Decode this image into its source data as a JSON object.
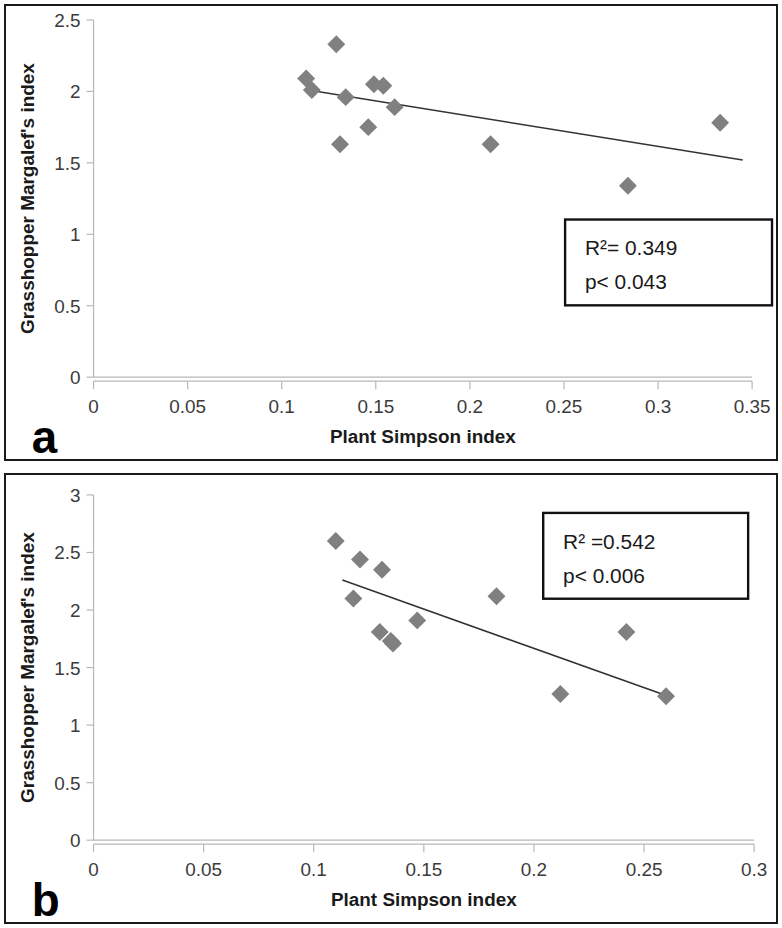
{
  "figure": {
    "panels": [
      {
        "letter": "a",
        "stats": {
          "r2": "R²= 0.349",
          "p": "p< 0.043"
        }
      },
      {
        "letter": "b",
        "stats": {
          "r2": "R² =0.542",
          "p": "p< 0.006"
        }
      }
    ]
  },
  "chart_data": [
    {
      "type": "scatter",
      "panel": "a",
      "title": "",
      "xlabel": "Plant Simpson index",
      "ylabel": "Grasshopper Margalef's index",
      "xlim": [
        0,
        0.35
      ],
      "ylim": [
        0,
        2.5
      ],
      "xticks": [
        0,
        0.05,
        0.1,
        0.15,
        0.2,
        0.25,
        0.3,
        0.35
      ],
      "xticklabels": [
        "0",
        "0.05",
        "0.1",
        "0.15",
        "0.2",
        "0.25",
        "0.3",
        "0.35"
      ],
      "yticks": [
        0,
        0.5,
        1,
        1.5,
        2,
        2.5
      ],
      "yticklabels": [
        "0",
        "0.5",
        "1",
        "1.5",
        "2",
        "2.5"
      ],
      "grid": false,
      "legend": null,
      "marker": "diamond",
      "marker_color": "#808080",
      "points": [
        {
          "x": 0.113,
          "y": 2.09
        },
        {
          "x": 0.116,
          "y": 2.01
        },
        {
          "x": 0.129,
          "y": 2.33
        },
        {
          "x": 0.131,
          "y": 1.63
        },
        {
          "x": 0.134,
          "y": 1.96
        },
        {
          "x": 0.146,
          "y": 1.75
        },
        {
          "x": 0.149,
          "y": 2.05
        },
        {
          "x": 0.154,
          "y": 2.04
        },
        {
          "x": 0.16,
          "y": 1.89
        },
        {
          "x": 0.211,
          "y": 1.63
        },
        {
          "x": 0.284,
          "y": 1.34
        },
        {
          "x": 0.333,
          "y": 1.78
        }
      ],
      "trendline": {
        "x0": 0.114,
        "y0": 2.01,
        "x1": 0.345,
        "y1": 1.52
      },
      "annotations": [
        {
          "text": "R²= 0.349",
          "x": 0.25,
          "y": 1.12
        },
        {
          "text": "p< 0.043",
          "x": 0.25,
          "y": 0.92
        }
      ],
      "r_squared": 0.349,
      "p_value": "< 0.043"
    },
    {
      "type": "scatter",
      "panel": "b",
      "title": "",
      "xlabel": "Plant Simpson index",
      "ylabel": "Grasshopper Margalef's index",
      "xlim": [
        0,
        0.3
      ],
      "ylim": [
        0,
        3
      ],
      "xticks": [
        0,
        0.05,
        0.1,
        0.15,
        0.2,
        0.25,
        0.3
      ],
      "xticklabels": [
        "0",
        "0.05",
        "0.1",
        "0.15",
        "0.2",
        "0.25",
        "0.3"
      ],
      "yticks": [
        0,
        0.5,
        1,
        1.5,
        2,
        2.5,
        3
      ],
      "yticklabels": [
        "0",
        "0.5",
        "1",
        "1.5",
        "2",
        "2.5",
        "3"
      ],
      "grid": false,
      "legend": null,
      "marker": "diamond",
      "marker_color": "#808080",
      "points": [
        {
          "x": 0.11,
          "y": 2.6
        },
        {
          "x": 0.118,
          "y": 2.1
        },
        {
          "x": 0.121,
          "y": 2.44
        },
        {
          "x": 0.131,
          "y": 2.35
        },
        {
          "x": 0.13,
          "y": 1.81
        },
        {
          "x": 0.135,
          "y": 1.73
        },
        {
          "x": 0.136,
          "y": 1.71
        },
        {
          "x": 0.147,
          "y": 1.91
        },
        {
          "x": 0.183,
          "y": 2.12
        },
        {
          "x": 0.212,
          "y": 1.27
        },
        {
          "x": 0.242,
          "y": 1.81
        },
        {
          "x": 0.26,
          "y": 1.25
        }
      ],
      "trendline": {
        "x0": 0.113,
        "y0": 2.26,
        "x1": 0.261,
        "y1": 1.25
      },
      "annotations": [
        {
          "text": "R² =0.542",
          "x": 0.205,
          "y": 2.62
        },
        {
          "text": "p< 0.006",
          "x": 0.205,
          "y": 2.4
        }
      ],
      "r_squared": 0.542,
      "p_value": "< 0.006"
    }
  ]
}
